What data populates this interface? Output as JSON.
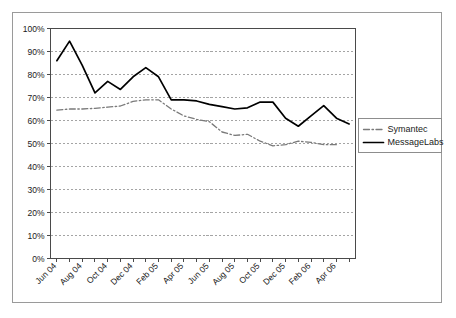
{
  "chart_data": {
    "type": "line",
    "title": "",
    "subtitle": "",
    "xlabel": "",
    "ylabel": "",
    "ylim": [
      0,
      1.0
    ],
    "ytick_labels": [
      "0%",
      "10%",
      "20%",
      "30%",
      "40%",
      "50%",
      "60%",
      "70%",
      "80%",
      "90%",
      "100%"
    ],
    "ytick_values": [
      0,
      10,
      20,
      30,
      40,
      50,
      60,
      70,
      80,
      90,
      100
    ],
    "grid": true,
    "grid_style": "dashed-horizontal",
    "legend_position": "right",
    "x": [
      "Jun 04",
      "Jul 04",
      "Aug 04",
      "Sep 04",
      "Oct 04",
      "Nov 04",
      "Dec 04",
      "Jan 05",
      "Feb 05",
      "Mar 05",
      "Apr 05",
      "May 05",
      "Jun 05",
      "Jul 05",
      "Aug 05",
      "Sep 05",
      "Oct 05",
      "Nov 05",
      "Dec 05",
      "Jan 06",
      "Feb 06",
      "Mar 06",
      "Apr 06",
      "May 06"
    ],
    "xtick_labels": [
      "Jun 04",
      "Aug 04",
      "Oct 04",
      "Dec 04",
      "Feb 05",
      "Apr 05",
      "Jun 05",
      "Aug 05",
      "Oct 05",
      "Dec 05",
      "Feb 06",
      "Apr 06"
    ],
    "xtick_label_rotation": -45,
    "xtick_label_interval": 2,
    "series": [
      {
        "name": "Symantec",
        "color": "#7a7a7a",
        "line_style": "dash-dot",
        "values": [
          64.5,
          65.0,
          65.0,
          65.3,
          65.8,
          66.3,
          68.3,
          69.0,
          69.0,
          65.0,
          62.0,
          60.5,
          59.5,
          55.0,
          53.5,
          54.0,
          51.0,
          49.0,
          49.5,
          51.0,
          50.5,
          49.5,
          49.5,
          null
        ]
      },
      {
        "name": "MessageLabs",
        "color": "#000000",
        "line_style": "solid",
        "values": [
          86.0,
          94.5,
          84.0,
          72.0,
          77.0,
          73.5,
          79.0,
          83.0,
          79.0,
          69.0,
          69.0,
          68.5,
          67.0,
          66.0,
          65.0,
          65.5,
          68.0,
          68.0,
          61.0,
          57.5,
          62.0,
          66.5,
          61.0,
          58.5
        ]
      }
    ]
  },
  "legend": {
    "entries": [
      {
        "label": "Symantec"
      },
      {
        "label": "MessageLabs"
      }
    ]
  }
}
